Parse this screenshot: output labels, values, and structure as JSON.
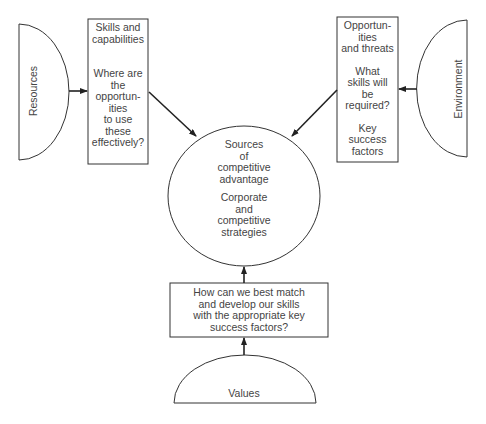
{
  "diagram": {
    "resources": {
      "label": "Resources"
    },
    "environment": {
      "label": "Environment"
    },
    "values": {
      "label": "Values"
    },
    "skills_box": {
      "heading": "Skills and\ncapabilities",
      "question": "Where are\nthe\nopportun-\nities\nto use\nthese\neffectively?"
    },
    "opportunities_box": {
      "heading": "Opportun-\nities\nand threats",
      "question": "What\nskills will\nbe\nrequired?",
      "factors": "Key\nsuccess\nfactors"
    },
    "center_circle": {
      "line1": "Sources\nof\ncompetitive\nadvantage",
      "line2": "Corporate\nand\ncompetitive\nstrategies"
    },
    "match_box": {
      "text": "How can we best match\nand develop our skills\nwith the appropriate key\nsuccess factors?"
    },
    "colors": {
      "stroke": "#333333",
      "text": "#444444",
      "background": "#ffffff"
    }
  }
}
